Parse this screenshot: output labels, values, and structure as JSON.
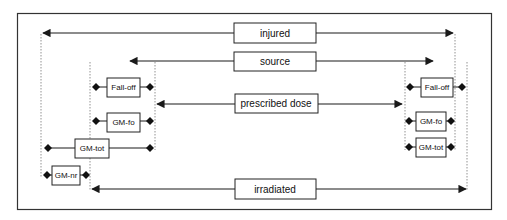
{
  "diagram": {
    "colors": {
      "line": "#1a1a1a",
      "dotted": "#777777",
      "background": "#ffffff"
    },
    "center_labels": {
      "injured": "injured",
      "source": "source",
      "prescribed_dose": "prescribed dose",
      "irradiated": "irradiated"
    },
    "left_labels": {
      "fall_off": "Fall-off",
      "gm_fo": "GM-fo",
      "gm_tot": "GM-tot",
      "gm_nr": "GM-nr"
    },
    "right_labels": {
      "fall_off": "Fall-off",
      "gm_fo": "GM-fo",
      "gm_tot": "GM-tot"
    }
  }
}
